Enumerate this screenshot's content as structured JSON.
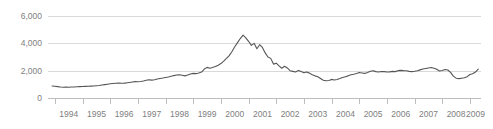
{
  "chart_data": {
    "type": "line",
    "title": "",
    "subtitle": "",
    "xlabel": "",
    "ylabel": "",
    "xlim": [
      1993.75,
      2009.4
    ],
    "ylim": [
      0,
      6000
    ],
    "grid": true,
    "legend": null,
    "y_ticks": [
      0,
      2000,
      4000,
      6000
    ],
    "y_tick_labels": [
      "0",
      "2,000",
      "4,000",
      "6,000"
    ],
    "x_ticks": [
      1994,
      1995,
      1996,
      1997,
      1998,
      1999,
      2000,
      2001,
      2002,
      2003,
      2004,
      2005,
      2006,
      2007,
      2008,
      2009
    ],
    "x_tick_labels": [
      "1994",
      "1995",
      "1996",
      "1997",
      "1998",
      "1999",
      "2000",
      "2001",
      "2002",
      "2003",
      "2004",
      "2005",
      "2006",
      "2007",
      "2008",
      "2009"
    ],
    "series": [
      {
        "name": "index",
        "color": "#555555",
        "x": [
          1993.9,
          1994.0,
          1994.1,
          1994.2,
          1994.3,
          1994.4,
          1994.5,
          1994.6,
          1994.7,
          1994.8,
          1994.9,
          1995.0,
          1995.1,
          1995.2,
          1995.3,
          1995.4,
          1995.5,
          1995.6,
          1995.7,
          1995.8,
          1995.9,
          1996.0,
          1996.1,
          1996.2,
          1996.3,
          1996.4,
          1996.5,
          1996.6,
          1996.7,
          1996.8,
          1996.9,
          1997.0,
          1997.1,
          1997.2,
          1997.3,
          1997.4,
          1997.5,
          1997.6,
          1997.7,
          1997.8,
          1997.9,
          1998.0,
          1998.1,
          1998.2,
          1998.3,
          1998.4,
          1998.5,
          1998.6,
          1998.7,
          1998.8,
          1998.9,
          1999.0,
          1999.1,
          1999.2,
          1999.3,
          1999.4,
          1999.5,
          1999.6,
          1999.7,
          1999.8,
          1999.9,
          2000.0,
          2000.1,
          2000.2,
          2000.3,
          2000.4,
          2000.5,
          2000.6,
          2000.7,
          2000.8,
          2000.9,
          2001.0,
          2001.1,
          2001.2,
          2001.3,
          2001.4,
          2001.5,
          2001.6,
          2001.7,
          2001.8,
          2001.9,
          2002.0,
          2002.1,
          2002.2,
          2002.3,
          2002.4,
          2002.5,
          2002.6,
          2002.7,
          2002.8,
          2002.9,
          2003.0,
          2003.1,
          2003.2,
          2003.3,
          2003.4,
          2003.5,
          2003.6,
          2003.7,
          2003.8,
          2003.9,
          2004.0,
          2004.1,
          2004.2,
          2004.3,
          2004.4,
          2004.5,
          2004.6,
          2004.7,
          2004.8,
          2004.9,
          2005.0,
          2005.1,
          2005.2,
          2005.3,
          2005.4,
          2005.5,
          2005.6,
          2005.7,
          2005.8,
          2005.9,
          2006.0,
          2006.1,
          2006.2,
          2006.3,
          2006.4,
          2006.5,
          2006.6,
          2006.7,
          2006.8,
          2006.9,
          2007.0,
          2007.1,
          2007.2,
          2007.3,
          2007.4,
          2007.5,
          2007.6,
          2007.7,
          2007.8,
          2007.9,
          2008.0,
          2008.1,
          2008.2,
          2008.3,
          2008.4,
          2008.5,
          2008.6,
          2008.7,
          2008.8,
          2008.9,
          2009.0,
          2009.1,
          2009.2,
          2009.3
        ],
        "y": [
          880,
          860,
          830,
          800,
          790,
          800,
          790,
          800,
          810,
          820,
          830,
          840,
          850,
          860,
          870,
          880,
          900,
          920,
          950,
          980,
          1010,
          1040,
          1060,
          1080,
          1090,
          1080,
          1090,
          1110,
          1140,
          1170,
          1200,
          1190,
          1210,
          1250,
          1300,
          1330,
          1310,
          1340,
          1390,
          1430,
          1460,
          1500,
          1540,
          1590,
          1640,
          1680,
          1700,
          1660,
          1620,
          1680,
          1760,
          1800,
          1780,
          1830,
          1900,
          2120,
          2240,
          2180,
          2230,
          2300,
          2400,
          2520,
          2700,
          2900,
          3100,
          3400,
          3750,
          4050,
          4350,
          4600,
          4400,
          4150,
          3850,
          4000,
          3600,
          3900,
          3700,
          3300,
          3000,
          2900,
          2480,
          2550,
          2350,
          2180,
          2320,
          2200,
          2000,
          1950,
          1900,
          2020,
          1940,
          1850,
          1900,
          1820,
          1700,
          1620,
          1560,
          1430,
          1300,
          1260,
          1280,
          1360,
          1320,
          1350,
          1420,
          1500,
          1560,
          1620,
          1700,
          1740,
          1790,
          1860,
          1830,
          1800,
          1870,
          1960,
          2000,
          1930,
          1900,
          1940,
          1930,
          1900,
          1910,
          1950,
          1930,
          2000,
          2020,
          2000,
          1990,
          1950,
          1930,
          1960,
          2000,
          2060,
          2120,
          2160,
          2200,
          2230,
          2180,
          2100,
          1980,
          2010,
          2080,
          2050,
          1880,
          1600,
          1450,
          1420,
          1450,
          1480,
          1560,
          1720,
          1780,
          1900,
          2120
        ]
      }
    ]
  }
}
